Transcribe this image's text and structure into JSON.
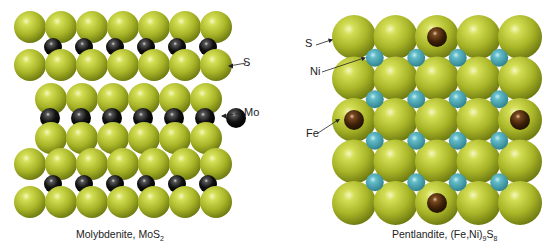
{
  "left_diagram": {
    "caption_prefix": "Molybdenite, MoS",
    "caption_sub": "2",
    "labels": {
      "s": "S",
      "mo": "Mo"
    }
  },
  "right_diagram": {
    "caption_prefix": "Pentlandite, (Fe,Ni)",
    "caption_sub1": "9",
    "caption_mid": "S",
    "caption_sub2": "8",
    "labels": {
      "s": "S",
      "ni": "Ni",
      "fe": "Fe"
    }
  },
  "colors": {
    "sulfur": "#b5c12a",
    "molybdenum": "#111111",
    "nickel": "#4aa6b3",
    "iron": "#4a2a10"
  }
}
